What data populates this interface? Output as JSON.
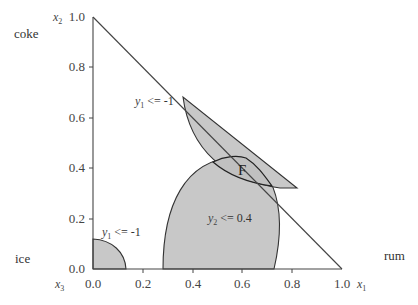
{
  "diagram": {
    "type": "ternary-feasible-region",
    "corner_labels": {
      "top": "coke",
      "left": "ice",
      "right": "rum"
    },
    "axis_vars": {
      "vertical": {
        "base": "x",
        "sub": "2"
      },
      "horizontal": {
        "base": "x",
        "sub": "1"
      },
      "origin": {
        "base": "x",
        "sub": "3"
      }
    },
    "x_ticks": [
      "0.0",
      "0.2",
      "0.4",
      "0.6",
      "0.8",
      "1.0"
    ],
    "y_ticks": [
      "0.0",
      "0.2",
      "0.4",
      "0.6",
      "0.8",
      "1.0"
    ],
    "regions": [
      {
        "name": "y1-constraint-upper",
        "label_base": "y",
        "label_sub": "1",
        "label_rest": " <= -1"
      },
      {
        "name": "y1-constraint-lower",
        "label_base": "y",
        "label_sub": "1",
        "label_rest": " <= -1"
      },
      {
        "name": "y2-constraint",
        "label_base": "y",
        "label_sub": "2",
        "label_rest": " <= 0.4"
      }
    ],
    "feasible_label": "F",
    "colors": {
      "fill": "#c8c8c8",
      "line": "#333333",
      "background": "#ffffff"
    }
  }
}
